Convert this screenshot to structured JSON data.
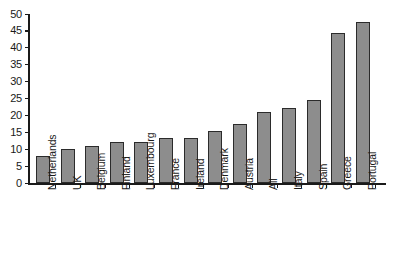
{
  "chart_data": {
    "type": "bar",
    "title": "",
    "xlabel": "",
    "ylabel": "",
    "ylim": [
      0,
      50
    ],
    "yticks": [
      0,
      5,
      10,
      15,
      20,
      25,
      30,
      35,
      40,
      45,
      50
    ],
    "grid": false,
    "legend": null,
    "bar_color": "#8d8d8d",
    "bar_edge_color": "#2b2b2b",
    "axis_color": "#1a1a1a",
    "categories": [
      "Netherlands",
      "UK",
      "Belgium",
      "Finland",
      "Luxembourg",
      "France",
      "Ireland",
      "Denmark",
      "Austria",
      "All",
      "Italy",
      "Spain",
      "Greece",
      "Portugal"
    ],
    "values": [
      8,
      10,
      11,
      12.2,
      12.2,
      13.2,
      13.2,
      15.3,
      17.5,
      21,
      22.3,
      24.5,
      44.5,
      47.5
    ]
  }
}
